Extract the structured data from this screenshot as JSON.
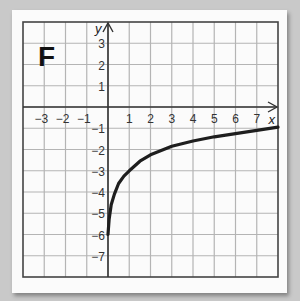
{
  "chart_data": {
    "type": "line",
    "title": "F",
    "xlabel": "x",
    "ylabel": "y",
    "xlim": [
      -4,
      8
    ],
    "ylim": [
      -8,
      4
    ],
    "grid": true,
    "x_ticks": [
      "-3",
      "-2",
      "-1",
      "1",
      "2",
      "3",
      "4",
      "5",
      "6",
      "7"
    ],
    "y_ticks": [
      "3",
      "2",
      "1",
      "-1",
      "-2",
      "-3",
      "-4",
      "-5",
      "-6",
      "-7"
    ],
    "series": [
      {
        "name": "curve",
        "x": [
          0,
          0.05,
          0.15,
          0.3,
          0.5,
          0.75,
          1,
          1.5,
          2,
          3,
          4,
          5,
          6,
          7,
          8
        ],
        "y": [
          -6,
          -5.3,
          -4.6,
          -4.1,
          -3.6,
          -3.25,
          -3,
          -2.55,
          -2.25,
          -1.85,
          -1.6,
          -1.4,
          -1.25,
          -1.1,
          -0.95
        ]
      }
    ]
  },
  "labels": {
    "title": "F",
    "x_axis": "x",
    "y_axis": "y",
    "x_ticks": [
      {
        "v": -3,
        "t": "−3"
      },
      {
        "v": -2,
        "t": "−2"
      },
      {
        "v": -1,
        "t": "−1"
      },
      {
        "v": 1,
        "t": "1"
      },
      {
        "v": 2,
        "t": "2"
      },
      {
        "v": 3,
        "t": "3"
      },
      {
        "v": 4,
        "t": "4"
      },
      {
        "v": 5,
        "t": "5"
      },
      {
        "v": 6,
        "t": "6"
      },
      {
        "v": 7,
        "t": "7"
      }
    ],
    "y_ticks": [
      {
        "v": 3,
        "t": "3"
      },
      {
        "v": 2,
        "t": "2"
      },
      {
        "v": 1,
        "t": "1"
      },
      {
        "v": -1,
        "t": "−1"
      },
      {
        "v": -2,
        "t": "−2"
      },
      {
        "v": -3,
        "t": "−3"
      },
      {
        "v": -4,
        "t": "−4"
      },
      {
        "v": -5,
        "t": "−5"
      },
      {
        "v": -6,
        "t": "−6"
      },
      {
        "v": -7,
        "t": "−7"
      }
    ]
  },
  "colors": {
    "grid": "#b4b4b4",
    "axis": "#333333",
    "curve": "#1e1e1e",
    "frame": "#444444"
  }
}
